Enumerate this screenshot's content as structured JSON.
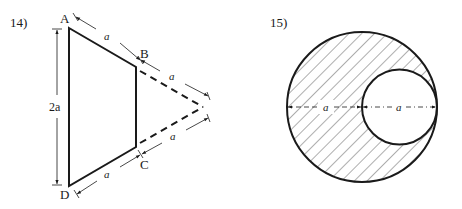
{
  "figures": [
    {
      "number": "14)",
      "vertices": {
        "A": "A",
        "B": "B",
        "C": "C",
        "D": "D"
      },
      "dimensions": {
        "left_height": "2a",
        "AB": "a",
        "B_apex": "a",
        "apex_C": "a",
        "CD": "a"
      },
      "description": "Trapezoid ABCD formed by cutting an equilateral-style triangle; dashed lines extend BC to apex"
    },
    {
      "number": "15)",
      "dimensions": {
        "left_radius_segment": "a",
        "right_diameter_segment": "a"
      },
      "description": "Large hatched circle with internally tangent smaller circular hole"
    }
  ],
  "colors": {
    "stroke": "#1a1a1a",
    "background": "#ffffff"
  }
}
